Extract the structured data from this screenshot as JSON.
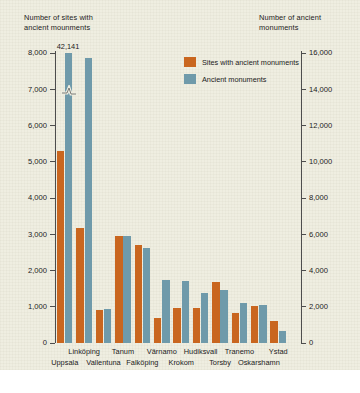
{
  "chart_data": {
    "type": "bar",
    "title": "",
    "ylabel": "Number of sites with\nancient mounments",
    "ylabel_right": "Number of ancient\nmonuments",
    "xlabel": "",
    "categories": [
      "Uppsala",
      "Linköping",
      "Vallentuna",
      "Tanum",
      "Falköping",
      "Värnamo",
      "Krokom",
      "Hudiksvall",
      "Torsby",
      "Tranemo",
      "Oskarshamn",
      "Ystad"
    ],
    "series": [
      {
        "name": "Sites with ancient monuments",
        "axis": "left",
        "color": "#c9661f",
        "values": [
          5300,
          3180,
          900,
          2950,
          2700,
          700,
          960,
          960,
          1680,
          820,
          1030,
          600
        ]
      },
      {
        "name": "Ancient monuments",
        "axis": "right",
        "color": "#6f9aaa",
        "values": [
          42141,
          15700,
          1900,
          5900,
          5250,
          3450,
          3400,
          2750,
          2950,
          2200,
          2080,
          680
        ]
      }
    ],
    "ylim": [
      0,
      8000
    ],
    "ylim_right": [
      0,
      16000
    ],
    "yticks": [
      "0",
      "1,000",
      "2,000",
      "3,000",
      "4,000",
      "5,000",
      "6,000",
      "7,000",
      "8,000"
    ],
    "yticks_right": [
      "0",
      "2,000",
      "4,000",
      "6,000",
      "8,000",
      "10,000",
      "12,000",
      "14,000",
      "16,000"
    ],
    "annotations": [
      {
        "text": "42,141",
        "category": "Uppsala",
        "series": "Ancient monuments",
        "note": "axis-break: bar truncated"
      }
    ],
    "grid": false,
    "legend_position": "upper-right-inside"
  },
  "legend": {
    "items": [
      {
        "label": "Sites with ancient monuments",
        "color": "#c9661f"
      },
      {
        "label": "Ancient monuments",
        "color": "#6f9aaa"
      }
    ]
  },
  "axes": {
    "left_title": "Number of sites with\nancient mounments",
    "right_title": "Number of ancient\nmonuments"
  },
  "colors": {
    "background": "#efeee1",
    "sites": "#c9661f",
    "monuments": "#6f9aaa",
    "axis": "#4d4d4d",
    "text": "#1b1b1b"
  }
}
